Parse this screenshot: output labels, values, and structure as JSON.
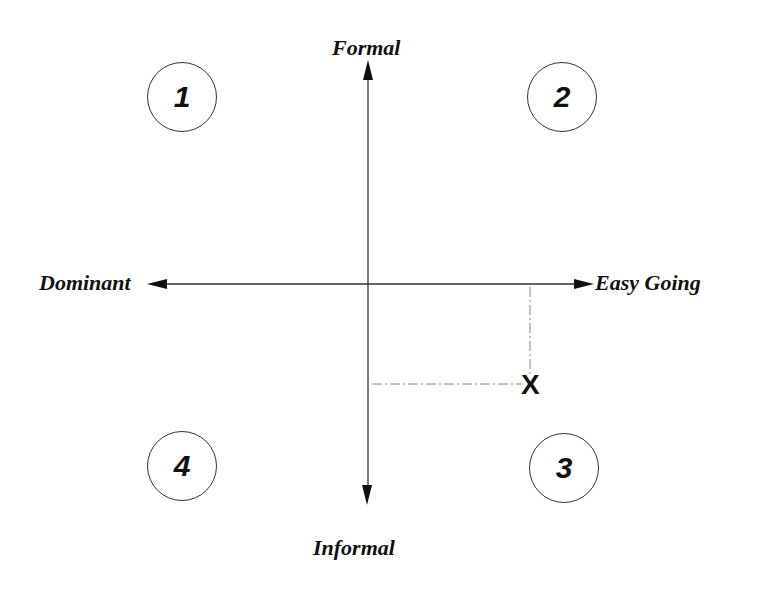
{
  "diagram": {
    "type": "quadrant-matrix",
    "axes": {
      "vertical": {
        "top_label": "Formal",
        "bottom_label": "Informal"
      },
      "horizontal": {
        "left_label": "Dominant",
        "right_label": "Easy Going"
      }
    },
    "quadrants": [
      {
        "id": "1",
        "label": "1",
        "position": "top-left"
      },
      {
        "id": "2",
        "label": "2",
        "position": "top-right"
      },
      {
        "id": "3",
        "label": "3",
        "position": "bottom-right"
      },
      {
        "id": "4",
        "label": "4",
        "position": "bottom-left"
      }
    ],
    "marker": {
      "label": "X",
      "quadrant": "3",
      "note": "plotted point with dashed guide lines to both axes"
    },
    "colors": {
      "ink": "#111111",
      "line": "#333333",
      "dashed_guide": "#888888",
      "background": "#ffffff"
    }
  }
}
